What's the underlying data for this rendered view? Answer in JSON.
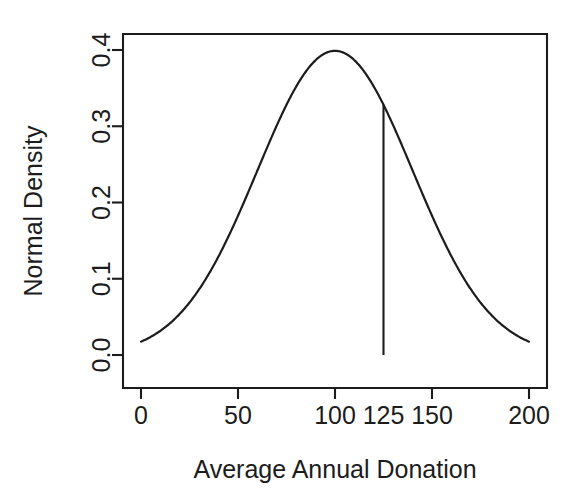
{
  "chart_data": {
    "type": "line",
    "title": "",
    "subtitle": "",
    "xlabel": "Average Annual Donation",
    "ylabel": "Normal Density",
    "xlim": [
      0,
      200
    ],
    "ylim": [
      0.0,
      0.4
    ],
    "grid": false,
    "legend": null,
    "box": true,
    "xticks": [
      {
        "value": 0,
        "label": "0"
      },
      {
        "value": 50,
        "label": "50"
      },
      {
        "value": 100,
        "label": "100"
      },
      {
        "value": 125,
        "label": "125"
      },
      {
        "value": 150,
        "label": "150"
      },
      {
        "value": 200,
        "label": "200"
      }
    ],
    "yticks": [
      {
        "value": 0.0,
        "label": "0.0"
      },
      {
        "value": 0.1,
        "label": "0.1"
      },
      {
        "value": 0.2,
        "label": "0.2"
      },
      {
        "value": 0.3,
        "label": "0.3"
      },
      {
        "value": 0.4,
        "label": "0.4"
      }
    ],
    "series": [
      {
        "name": "Normal density",
        "kind": "curve",
        "mean": 100,
        "sd": 40,
        "peak": {
          "x": 100,
          "y": 0.3989
        },
        "x": [
          0,
          5,
          10,
          15,
          20,
          25,
          30,
          35,
          40,
          45,
          50,
          55,
          60,
          65,
          70,
          75,
          80,
          85,
          90,
          95,
          100,
          105,
          110,
          115,
          120,
          125,
          130,
          135,
          140,
          145,
          150,
          155,
          160,
          165,
          170,
          175,
          180,
          185,
          190,
          195,
          200
        ],
        "y": [
          0.0175,
          0.0228,
          0.0294,
          0.0371,
          0.0463,
          0.0567,
          0.0685,
          0.0814,
          0.0952,
          0.1095,
          0.124,
          0.1381,
          0.1515,
          0.1636,
          0.174,
          0.1823,
          0.1881,
          0.1914,
          0.192,
          0.1899,
          0.1995,
          0.1899,
          0.192,
          0.1914,
          0.1881,
          0.1823,
          0.174,
          0.1636,
          0.1515,
          0.1381,
          0.124,
          0.1095,
          0.0952,
          0.0814,
          0.0685,
          0.0567,
          0.0463,
          0.0371,
          0.0294,
          0.0228,
          0.0175
        ]
      }
    ],
    "annotations": [
      {
        "type": "vertical-line",
        "name": "cutoff-line-at-125",
        "x": 125,
        "y_bottom": 0.0,
        "y_top": 0.3247,
        "label": "125"
      }
    ],
    "endpoints": {
      "left": {
        "x": 0,
        "y": 0.0175
      },
      "right": {
        "x": 200,
        "y": 0.0175
      }
    }
  }
}
